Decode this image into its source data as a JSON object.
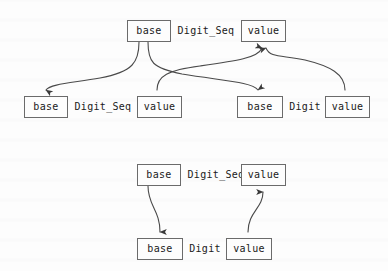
{
  "figure": {
    "type": "term-graph-diagram",
    "background_color": "#fdfdfd",
    "node_border_color": "#6b6b6b",
    "edge_color": "#4a4a4a",
    "text_color": "#1a1a1a",
    "width": 388,
    "height": 271
  },
  "diagrams": [
    {
      "id": "upper",
      "rows": [
        {
          "id": "upper-row-1",
          "cells": [
            {
              "kind": "node",
              "text": "base",
              "x": 127,
              "y": 20,
              "w": 44
            },
            {
              "kind": "label",
              "text": "Digit_Seq",
              "x": 175,
              "y": 20,
              "w": 62
            },
            {
              "kind": "node",
              "text": "value",
              "x": 241,
              "y": 20,
              "w": 45
            }
          ]
        },
        {
          "id": "upper-row-2",
          "cells": [
            {
              "kind": "node",
              "text": "base",
              "x": 24,
              "y": 96,
              "w": 44
            },
            {
              "kind": "label",
              "text": "Digit_Seq",
              "x": 72,
              "y": 96,
              "w": 62
            },
            {
              "kind": "node",
              "text": "value",
              "x": 137,
              "y": 96,
              "w": 45
            },
            {
              "kind": "node",
              "text": "base",
              "x": 237,
              "y": 96,
              "w": 46
            },
            {
              "kind": "label",
              "text": "Digit",
              "x": 287,
              "y": 96,
              "w": 36
            },
            {
              "kind": "node",
              "text": "value",
              "x": 325,
              "y": 96,
              "w": 45
            }
          ]
        }
      ],
      "edges": [
        {
          "id": "u-e1",
          "from": "upper-base-top",
          "to": "upper-base-left",
          "direction": "down",
          "path": "M 139,42 C 139,62 133,72 100,78 C 72,83 50,84 46,90"
        },
        {
          "id": "u-e2",
          "from": "upper-base-top",
          "to": "upper-base-right",
          "direction": "down",
          "path": "M 148,42 C 148,62 152,68 182,74 C 225,81 252,82 258,90"
        },
        {
          "id": "u-e3",
          "from": "upper-value-left",
          "to": "upper-value-top",
          "direction": "up",
          "path": "M 157,90 C 157,76 168,70 200,66 C 236,61 258,58 262,48"
        },
        {
          "id": "u-e4",
          "from": "upper-value-right",
          "to": "upper-value-top",
          "direction": "up",
          "path": "M 345,90 C 345,74 330,66 305,60 C 282,55 270,58 266,48"
        }
      ]
    },
    {
      "id": "lower",
      "rows": [
        {
          "id": "lower-row-1",
          "cells": [
            {
              "kind": "node",
              "text": "base",
              "x": 137,
              "y": 164,
              "w": 44
            },
            {
              "kind": "label",
              "text": "Digit_Seq",
              "x": 185,
              "y": 164,
              "w": 62
            },
            {
              "kind": "node",
              "text": "value",
              "x": 241,
              "y": 164,
              "w": 45
            }
          ]
        },
        {
          "id": "lower-row-2",
          "cells": [
            {
              "kind": "node",
              "text": "base",
              "x": 137,
              "y": 238,
              "w": 46
            },
            {
              "kind": "label",
              "text": "Digit",
              "x": 187,
              "y": 238,
              "w": 36
            },
            {
              "kind": "node",
              "text": "value",
              "x": 226,
              "y": 238,
              "w": 46
            }
          ]
        }
      ],
      "edges": [
        {
          "id": "l-e1",
          "from": "lower-base-top",
          "to": "lower-base-bottom",
          "direction": "down",
          "path": "M 148,186 C 148,206 160,210 160,232"
        },
        {
          "id": "l-e2",
          "from": "lower-value-bottom",
          "to": "lower-value-top",
          "direction": "up",
          "path": "M 248,232 C 248,212 263,208 263,192"
        }
      ]
    }
  ]
}
